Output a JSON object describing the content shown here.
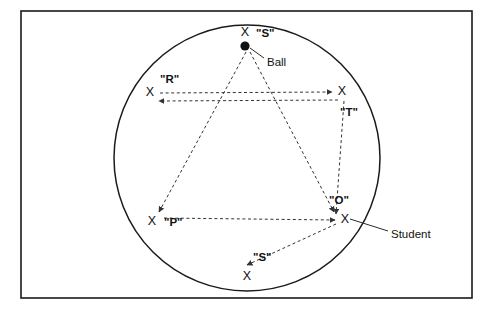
{
  "diagram": {
    "colors": {
      "ink": "#111111",
      "frame": "#1a1a1a",
      "dashed": "#333333",
      "background": "#ffffff"
    },
    "frame": {
      "x": 21,
      "y": 11,
      "width": 451,
      "height": 287
    },
    "circle": {
      "cx": 247,
      "cy": 158,
      "r": 133
    },
    "ball": {
      "cx": 245,
      "cy": 46,
      "r": 4.6
    },
    "students": [
      {
        "id": "student-s-top",
        "label": "\"S\"",
        "x": 245,
        "y": 33,
        "label_x": 256,
        "label_y": 37
      },
      {
        "id": "student-r",
        "label": "\"R\"",
        "x": 150,
        "y": 93,
        "label_x": 160,
        "label_y": 83
      },
      {
        "id": "student-t",
        "label": "\"T\"",
        "x": 342,
        "y": 92,
        "label_x": 340,
        "label_y": 116
      },
      {
        "id": "student-p",
        "label": "\"P\"",
        "x": 152,
        "y": 222,
        "label_x": 164,
        "label_y": 226
      },
      {
        "id": "student-o",
        "label": "\"O\"",
        "x": 345,
        "y": 220,
        "label_x": 329,
        "label_y": 204
      },
      {
        "id": "student-s-bottom",
        "label": "\"S\"",
        "x": 247,
        "y": 277,
        "label_x": 253,
        "label_y": 261
      }
    ],
    "passes": [
      {
        "id": "pass-r-to-t",
        "from": "R",
        "to": "T",
        "path": "M 160 93 L 332 92"
      },
      {
        "id": "pass-t-to-o",
        "from": "T",
        "to": "O",
        "path": "M 344 101 L 336 214"
      },
      {
        "id": "pass-o-to-p",
        "from": "O",
        "to": "P",
        "path": "M 335 220 L 163 218"
      },
      {
        "id": "pass-p-to-s",
        "from": "P",
        "to": "S",
        "path": "M 159 212 L 246 46"
      },
      {
        "id": "pass-s-to-o",
        "from": "S",
        "to": "O",
        "path": "M 248 50 L 332 211"
      },
      {
        "id": "pass-t-to-r",
        "from": "T",
        "to": "R",
        "path": "M 338 100 L 157 101"
      },
      {
        "id": "pass-o-to-s-bottom",
        "from": "O",
        "to": "S",
        "path": "M 335 224 L 246 265"
      }
    ],
    "callouts": [
      {
        "id": "callout-ball",
        "label": "Ball",
        "label_x": 267,
        "label_y": 62,
        "line": "M 264 58 L 250 48"
      },
      {
        "id": "callout-student",
        "label": "Student",
        "label_x": 391,
        "label_y": 234,
        "line": "M 388 231 L 350 219"
      }
    ]
  }
}
